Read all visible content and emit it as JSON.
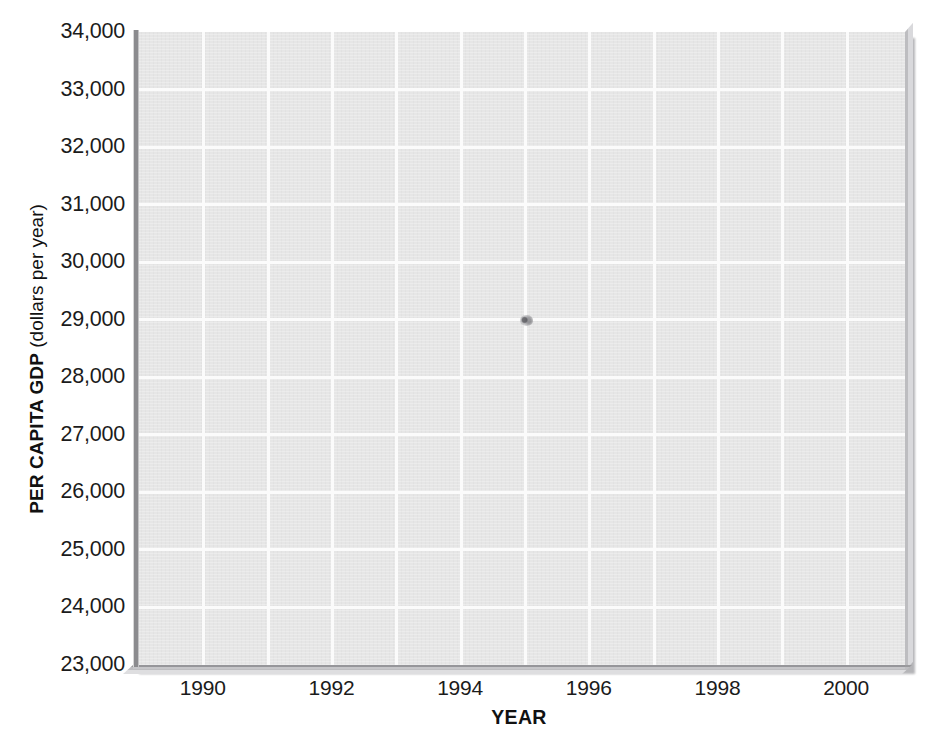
{
  "chart_data": {
    "type": "scatter",
    "title": "",
    "subtitle": "",
    "xlabel": "YEAR",
    "ylabel": "PER CAPITA GDP (dollars per year)",
    "ylabel_bold_part": "PER CAPITA GDP",
    "ylabel_light_part": " (dollars per year)",
    "x": [],
    "values": [],
    "series": [],
    "xlim": [
      1988.9,
      2000.9
    ],
    "ylim": [
      23000,
      34000
    ],
    "x_tick_labels": [
      "1990",
      "1992",
      "1994",
      "1996",
      "1998",
      "2000"
    ],
    "x_tick_values": [
      1990,
      1992,
      1994,
      1996,
      1998,
      2000
    ],
    "x_gridline_values": [
      1990,
      1991,
      1992,
      1993,
      1994,
      1995,
      1996,
      1997,
      1998,
      1999,
      2000
    ],
    "y_tick_labels": [
      "34,000",
      "33,000",
      "32,000",
      "31,000",
      "30,000",
      "29,000",
      "28,000",
      "27,000",
      "26,000",
      "25,000",
      "24,000",
      "23,000"
    ],
    "y_tick_values": [
      34000,
      33000,
      32000,
      31000,
      30000,
      29000,
      28000,
      27000,
      26000,
      25000,
      24000,
      23000
    ],
    "y_gridline_values": [
      33000,
      32000,
      31000,
      30000,
      29000,
      28000,
      27000,
      26000,
      25000,
      24000
    ],
    "grid": true,
    "legend": null,
    "legend_position": "none",
    "annotations": [],
    "note": "Blank grid template — no data series plotted; a single small ink smudge artifact sits near the 1993 / 29,600 position.",
    "colors": {
      "panel_background": "#e6e6e6",
      "gridline": "#fbfbfb",
      "axis_rule": "#8b8b8e",
      "text": "#1b1b1b",
      "page_background": "#ffffff",
      "shadow": "#a9a9ac"
    }
  },
  "page": {
    "top_residue_text": "",
    "smudge_label": "ink-smudge-artifact"
  }
}
